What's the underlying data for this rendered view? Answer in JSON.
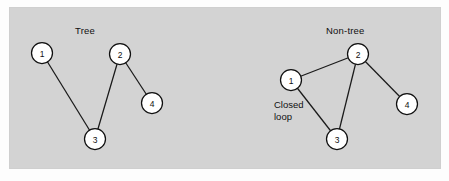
{
  "figure": {
    "background_color": "#fdfdfd",
    "panel_color": "#d3d3d3",
    "panel_border_color": "#cfcfcf",
    "node_fill": "#ffffff",
    "node_stroke": "#101010",
    "edge_color": "#1a1a1a",
    "text_color": "#101010"
  },
  "graphs": [
    {
      "id": "tree",
      "title": "Tree",
      "title_pos": {
        "x": 75,
        "y": 25
      },
      "nodes": [
        {
          "id": "n1",
          "label": "1",
          "cx": 42,
          "cy": 53,
          "r": 10.5
        },
        {
          "id": "n2",
          "label": "2",
          "cx": 120,
          "cy": 54,
          "r": 10.5
        },
        {
          "id": "n3",
          "label": "3",
          "cx": 95,
          "cy": 139,
          "r": 10.5
        },
        {
          "id": "n4",
          "label": "4",
          "cx": 152,
          "cy": 103,
          "r": 10.5
        }
      ],
      "edges": [
        {
          "from": "n1",
          "to": "n3"
        },
        {
          "from": "n3",
          "to": "n2"
        },
        {
          "from": "n2",
          "to": "n4"
        }
      ],
      "annotations": []
    },
    {
      "id": "non-tree",
      "title": "Non-tree",
      "title_pos": {
        "x": 326,
        "y": 25
      },
      "nodes": [
        {
          "id": "n1",
          "label": "1",
          "cx": 291,
          "cy": 80,
          "r": 10.5
        },
        {
          "id": "n2",
          "label": "2",
          "cx": 358,
          "cy": 54,
          "r": 10.5
        },
        {
          "id": "n3",
          "label": "3",
          "cx": 337,
          "cy": 139,
          "r": 10.5
        },
        {
          "id": "n4",
          "label": "4",
          "cx": 407,
          "cy": 104,
          "r": 10.5
        }
      ],
      "edges": [
        {
          "from": "n1",
          "to": "n2"
        },
        {
          "from": "n2",
          "to": "n3"
        },
        {
          "from": "n1",
          "to": "n3"
        },
        {
          "from": "n2",
          "to": "n4"
        }
      ],
      "annotations": [
        {
          "id": "closed-loop",
          "text_line1": "Closed",
          "text_line2": "loop",
          "x": 274,
          "y": 99
        }
      ]
    }
  ],
  "labels": {
    "tree_title": "Tree",
    "nontree_title": "Non-tree",
    "closed_loop_line1": "Closed",
    "closed_loop_line2": "loop"
  }
}
